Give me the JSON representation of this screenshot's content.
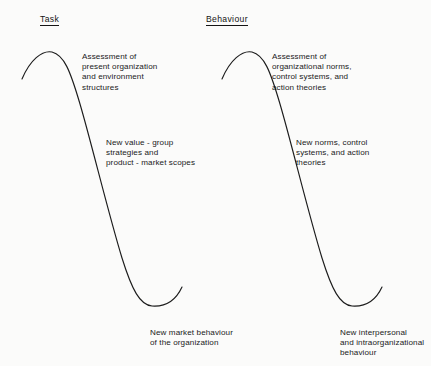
{
  "figure": {
    "background_color": "#fbfbfa",
    "ink_color": "#1c1c1c"
  },
  "columns": [
    {
      "heading": "Task",
      "notes": {
        "top": "Assessment of\npresent organization\nand environment\nstructures",
        "middle": "New value - group\nstrategies and\nproduct - market scopes",
        "bottom": "New market behaviour\nof the organization"
      }
    },
    {
      "heading": "Behaviour",
      "notes": {
        "top": "Assessment of\norganizational norms,\ncontrol systems, and\naction theories",
        "middle": "New norms, control\nsystems, and action\ntheories",
        "bottom": "New interpersonal\nand intraorganizational\nbehaviour"
      }
    }
  ],
  "chart_data": {
    "type": "line",
    "title": "",
    "xlabel": "",
    "ylabel": "",
    "grid": false,
    "legend": "none",
    "series": [
      {
        "name": "Task",
        "comment": "inverted sigmoid / S-curve drawn freehand; coordinates in screenshot pixel space",
        "path": "M 22 79 C 30 60, 42 50, 52 52 C 64 55, 70 70, 80 104 C 92 145, 108 212, 122 258 C 132 290, 140 305, 152 306 C 166 307, 176 300, 182 287"
      },
      {
        "name": "Behaviour",
        "comment": "same S-curve translated +200 px in x",
        "path": "M 222 79 C 230 60, 242 50, 252 52 C 264 55, 270 70, 280 104 C 292 145, 308 212, 322 258 C 332 290, 340 305, 352 306 C 366 307, 376 300, 382 287"
      }
    ]
  }
}
